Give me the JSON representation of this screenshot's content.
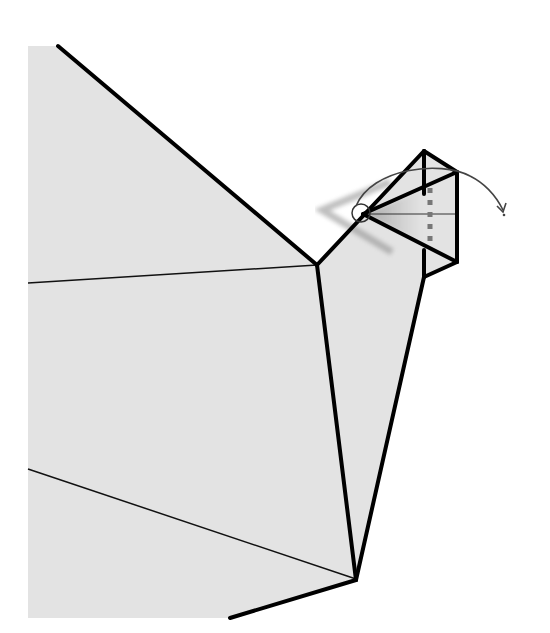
{
  "page": {
    "type": "origami-instruction-diagram",
    "caption_partial": "",
    "paper_color": "#e3e3e3",
    "line_color": "#000000",
    "arrow_color": "#444444",
    "shadow_color": "#9a9a9a"
  },
  "diagram": {
    "elements": {
      "body_fill": "paper",
      "fold_lines": [
        "thin crease upper",
        "thin crease lower"
      ],
      "head": "triangular head with dashed pleat",
      "beak_circle": "reference point circle",
      "action_arrow": "curved fold arrow pointing right-down",
      "ghost_shadow": "shaded chevron showing motion of beak"
    }
  }
}
